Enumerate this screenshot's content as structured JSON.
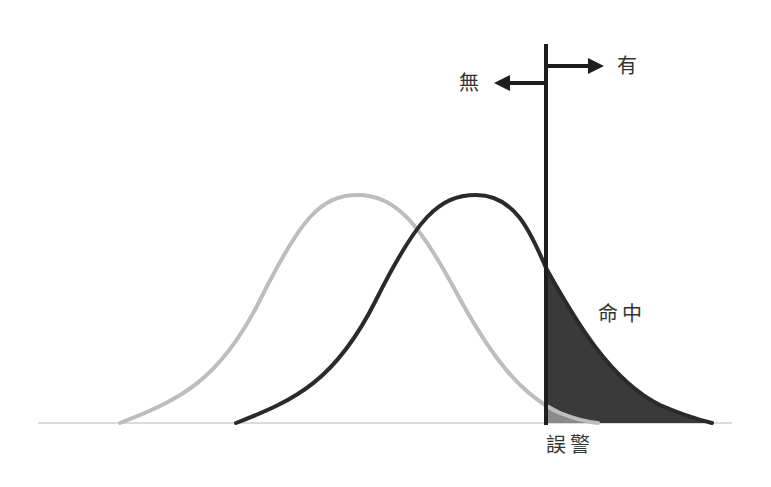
{
  "diagram": {
    "title": "",
    "labels": {
      "absent": "無",
      "present": "有",
      "hit": "命中",
      "false_alarm": "誤警"
    },
    "curves": [
      {
        "name": "noise-distribution",
        "color": "#bdbdbd",
        "peak_x": 358,
        "peak_y": 195,
        "start_x": 120,
        "end_x": 598
      },
      {
        "name": "signal-distribution",
        "color": "#2a2a2a",
        "peak_x": 476,
        "peak_y": 195,
        "start_x": 236,
        "end_x": 712
      }
    ],
    "criterion_x": 546,
    "baseline_y": 423,
    "colors": {
      "baseline": "#cfcfcf",
      "criterion": "#1e1e1e",
      "hit_fill": "#3a3a3a",
      "false_alarm_fill": "#8a8a8a"
    }
  }
}
